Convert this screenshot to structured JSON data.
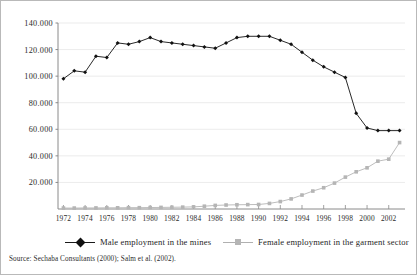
{
  "source_note": "Source:  Sechaba Consultants (2000); Salm et al. (2002).",
  "legend": {
    "male": {
      "label": "Male employment in the mines",
      "marker": "diamond-marker",
      "color": "#111111"
    },
    "female": {
      "label": "Female employment in the garment sector",
      "marker": "square-marker",
      "color": "#b5b5b5"
    }
  },
  "axes": {
    "y_tick_labels": [
      "140.000",
      "120.000",
      "100.000",
      "80.000",
      "60.000",
      "40.000",
      "20.000"
    ],
    "x_tick_labels": [
      "1972",
      "1974",
      "1976",
      "1978",
      "1980",
      "1982",
      "1984",
      "1986",
      "1988",
      "1990",
      "1992",
      "1994",
      "1996",
      "1998",
      "2000",
      "2002"
    ]
  },
  "chart_data": {
    "type": "line",
    "title": "",
    "subtitle": "",
    "xlabel": "",
    "ylabel": "",
    "xlim": [
      1971.5,
      2003.5
    ],
    "ylim": [
      0,
      140000
    ],
    "grid": true,
    "grid_axis": "y",
    "legend_position": "bottom",
    "y_ticks": [
      20000,
      40000,
      60000,
      80000,
      100000,
      120000,
      140000
    ],
    "y_tick_labels": [
      "20.000",
      "40.000",
      "60.000",
      "80.000",
      "100.000",
      "120.000",
      "140.000"
    ],
    "x_ticks": [
      1972,
      1974,
      1976,
      1978,
      1980,
      1982,
      1984,
      1986,
      1988,
      1990,
      1992,
      1994,
      1996,
      1998,
      2000,
      2002
    ],
    "x": [
      1972,
      1973,
      1974,
      1975,
      1976,
      1977,
      1978,
      1979,
      1980,
      1981,
      1982,
      1983,
      1984,
      1985,
      1986,
      1987,
      1988,
      1989,
      1990,
      1991,
      1992,
      1993,
      1994,
      1995,
      1996,
      1997,
      1998,
      1999,
      2000,
      2001,
      2002,
      2003
    ],
    "series": [
      {
        "name": "Male employment in the mines",
        "color": "#111111",
        "marker": "diamond",
        "values": [
          98000,
          104000,
          103000,
          115000,
          114000,
          125000,
          124000,
          126000,
          129000,
          126000,
          125000,
          124000,
          123000,
          122000,
          121000,
          125000,
          129000,
          130000,
          130000,
          130000,
          127000,
          124000,
          118000,
          112000,
          107000,
          103000,
          99000,
          72000,
          61000,
          59000,
          59000,
          59000
        ]
      },
      {
        "name": "Female employment in the garment sector",
        "color": "#b5b5b5",
        "marker": "square",
        "values": [
          700,
          700,
          800,
          800,
          900,
          900,
          1000,
          1000,
          1100,
          1200,
          1300,
          1400,
          1600,
          2100,
          2700,
          3000,
          3200,
          3300,
          3400,
          4200,
          5600,
          7600,
          10500,
          13500,
          16000,
          19500,
          24000,
          28000,
          31000,
          36000,
          37500,
          50000
        ]
      }
    ]
  }
}
